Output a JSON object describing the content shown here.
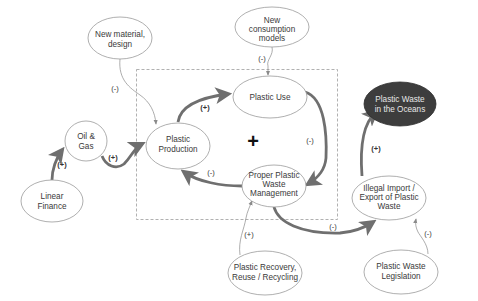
{
  "diagram": {
    "type": "causal-loop-diagram",
    "colors": {
      "node_fill": "#ffffff",
      "node_stroke": "#9a9a9a",
      "dark_node_fill": "#3d3d3d",
      "thick_arrow": "#6f6f6f",
      "thin_arrow": "#8a8a8a",
      "dashed_box": "#a8a8a8"
    },
    "loop_polarity": "+",
    "nodes": [
      {
        "id": "new_material",
        "lines": [
          "New material,",
          "design"
        ]
      },
      {
        "id": "new_consumption",
        "lines": [
          "New",
          "consumption",
          "models"
        ]
      },
      {
        "id": "plastic_use",
        "lines": [
          "Plastic Use"
        ]
      },
      {
        "id": "plastic_production",
        "lines": [
          "Plastic",
          "Production"
        ]
      },
      {
        "id": "oil_gas",
        "lines": [
          "Oil &",
          "Gas"
        ]
      },
      {
        "id": "linear_finance",
        "lines": [
          "Linear",
          "Finance"
        ]
      },
      {
        "id": "proper_waste_mgmt",
        "lines": [
          "Proper Plastic",
          "Waste",
          "Management"
        ]
      },
      {
        "id": "waste_oceans",
        "lines": [
          "Plastic Waste",
          "in the Oceans"
        ]
      },
      {
        "id": "illegal_trade",
        "lines": [
          "Illegal Import /",
          "Export of Plastic",
          "Waste"
        ]
      },
      {
        "id": "recovery",
        "lines": [
          "Plastic Recovery,",
          "Reuse / Recycling"
        ]
      },
      {
        "id": "legislation",
        "lines": [
          "Plastic Waste",
          "Legislation"
        ]
      }
    ],
    "links": [
      {
        "from": "linear_finance",
        "to": "oil_gas",
        "sign": "(+)",
        "weight": "thick"
      },
      {
        "from": "oil_gas",
        "to": "plastic_production",
        "sign": "(+)",
        "weight": "thick"
      },
      {
        "from": "plastic_production",
        "to": "plastic_use",
        "sign": "(+)",
        "weight": "thick"
      },
      {
        "from": "plastic_use",
        "to": "proper_waste_mgmt",
        "sign": "(-)",
        "weight": "thick"
      },
      {
        "from": "proper_waste_mgmt",
        "to": "plastic_production",
        "sign": "(-)",
        "weight": "thick"
      },
      {
        "from": "proper_waste_mgmt",
        "to": "illegal_trade",
        "sign": "(-)",
        "weight": "thick"
      },
      {
        "from": "illegal_trade",
        "to": "waste_oceans",
        "sign": "(+)",
        "weight": "thick"
      },
      {
        "from": "new_material",
        "to": "plastic_production",
        "sign": "(-)",
        "weight": "thin"
      },
      {
        "from": "new_consumption",
        "to": "plastic_use",
        "sign": "(-)",
        "weight": "thin"
      },
      {
        "from": "recovery",
        "to": "proper_waste_mgmt",
        "sign": "(+)",
        "weight": "thin"
      },
      {
        "from": "legislation",
        "to": "illegal_trade",
        "sign": "(-)",
        "weight": "thin"
      }
    ]
  },
  "labels": {
    "new_material_1": "New material,",
    "new_material_2": "design",
    "new_consumption_1": "New",
    "new_consumption_2": "consumption",
    "new_consumption_3": "models",
    "plastic_use_1": "Plastic Use",
    "plastic_production_1": "Plastic",
    "plastic_production_2": "Production",
    "oil_gas_1": "Oil &",
    "oil_gas_2": "Gas",
    "linear_finance_1": "Linear",
    "linear_finance_2": "Finance",
    "proper_waste_1": "Proper Plastic",
    "proper_waste_2": "Waste",
    "proper_waste_3": "Management",
    "waste_oceans_1": "Plastic Waste",
    "waste_oceans_2": "in the Oceans",
    "illegal_1": "Illegal Import /",
    "illegal_2": "Export of Plastic",
    "illegal_3": "Waste",
    "recovery_1": "Plastic Recovery,",
    "recovery_2": "Reuse / Recycling",
    "legislation_1": "Plastic Waste",
    "legislation_2": "Legislation",
    "loop_sign": "+"
  },
  "signs": {
    "finance_to_oil": "(+)",
    "oil_to_production": "(+)",
    "production_to_use": "(+)",
    "use_to_mgmt": "(-)",
    "mgmt_to_production": "(-)",
    "mgmt_to_illegal": "(-)",
    "illegal_to_oceans": "(+)",
    "material_to_production": "(-)",
    "consumption_to_use": "(-)",
    "recovery_to_mgmt": "(+)",
    "legislation_to_illegal": "(-)"
  }
}
